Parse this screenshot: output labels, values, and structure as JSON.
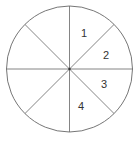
{
  "diagram": {
    "type": "circle-divided-into-sectors",
    "sector_count": 8,
    "center": [
      69.5,
      69
    ],
    "radius": 63,
    "stroke_color": "#666666",
    "labels": [
      {
        "text": "1",
        "x": 84,
        "y": 37
      },
      {
        "text": "2",
        "x": 106,
        "y": 59
      },
      {
        "text": "3",
        "x": 104,
        "y": 88
      },
      {
        "text": "4",
        "x": 81,
        "y": 110
      }
    ]
  }
}
